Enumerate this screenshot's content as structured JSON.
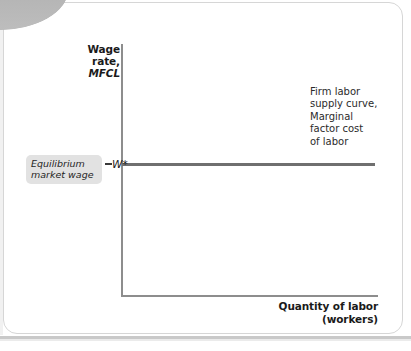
{
  "figure": {
    "type": "economics-diagram"
  },
  "axes": {
    "y_title_line1": "Wage",
    "y_title_line2": "rate,",
    "y_title_line3": "MFCL",
    "x_title_line1": "Quantity of labor",
    "x_title_line2": "(workers)"
  },
  "annotations": {
    "curve_label_line1": "Firm labor",
    "curve_label_line2": "supply curve,",
    "curve_label_line3": "Marginal",
    "curve_label_line4": "factor cost",
    "curve_label_line5": "of labor",
    "equilibrium_label_line1": "Equilibrium",
    "equilibrium_label_line2": "market wage",
    "wage_marker": "W*"
  },
  "chart_data": {
    "type": "line",
    "title": "",
    "xlabel": "Quantity of labor (workers)",
    "ylabel": "Wage rate, MFCL",
    "xlim": [
      0,
      100
    ],
    "ylim": [
      0,
      100
    ],
    "grid": false,
    "legend_position": "inline-annotation",
    "series": [
      {
        "name": "Firm labor supply curve, Marginal factor cost of labor",
        "x": [
          0,
          100
        ],
        "values": [
          52.5,
          52.5
        ],
        "style": "solid",
        "color": "#6f6f6f",
        "note": "perfectly elastic (horizontal) at W*"
      }
    ],
    "reference_lines": [
      {
        "name": "Equilibrium market wage",
        "axis": "y",
        "value": 52.5,
        "tick_label": "W*"
      }
    ]
  },
  "colors": {
    "curve": "#6f6f6f",
    "axis": "#8d8d8d",
    "callout_background": "#e2e2e2",
    "frame_border": "#d6d6d6",
    "corner_decoration": "#b3b3b3"
  }
}
